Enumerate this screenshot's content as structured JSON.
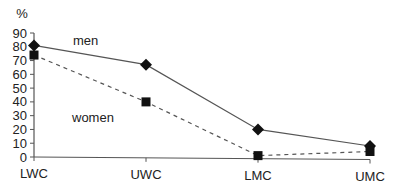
{
  "chart_data": {
    "type": "line",
    "title": "",
    "xlabel": "",
    "ylabel": "%",
    "ylim": [
      0,
      90
    ],
    "yticks": [
      0,
      10,
      20,
      30,
      40,
      50,
      60,
      70,
      80,
      90
    ],
    "grid": false,
    "legend": "inline labels",
    "categories": [
      "LWC",
      "UWC",
      "LMC",
      "UMC"
    ],
    "series": [
      {
        "name": "men",
        "values": [
          81,
          67,
          20,
          8
        ],
        "marker": "diamond",
        "line": "solid"
      },
      {
        "name": "women",
        "values": [
          74,
          40,
          1,
          4
        ],
        "marker": "square",
        "line": "dashed"
      }
    ],
    "annotations": [
      {
        "text": "men",
        "near": "men series between LWC and UWC"
      },
      {
        "text": "women",
        "near": "women series below UWC"
      }
    ]
  },
  "colors": {
    "line": "#555555",
    "marker": "#111111",
    "text": "#222222"
  }
}
